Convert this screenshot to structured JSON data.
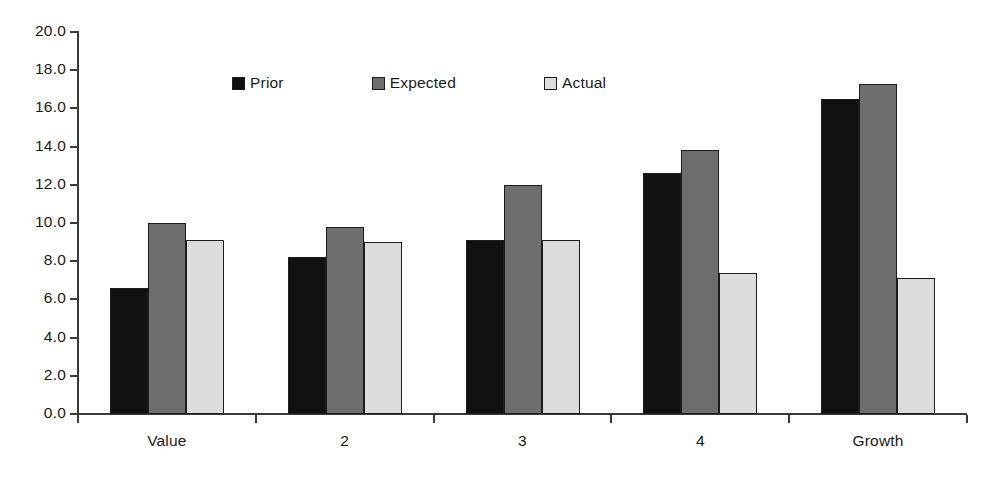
{
  "chart_data": {
    "type": "bar",
    "title": "",
    "subtitle": "",
    "xlabel": "",
    "ylabel": "",
    "categories": [
      "Value",
      "2",
      "3",
      "4",
      "Growth"
    ],
    "series": [
      {
        "name": "Prior",
        "color": "#111111",
        "values": [
          6.6,
          8.2,
          9.1,
          12.6,
          16.5
        ]
      },
      {
        "name": "Expected",
        "color": "#6e6e6e",
        "values": [
          10.0,
          9.8,
          12.0,
          13.8,
          17.3
        ]
      },
      {
        "name": "Actual",
        "color": "#dcdcdc",
        "values": [
          9.1,
          9.0,
          9.1,
          7.4,
          7.1
        ]
      }
    ],
    "ylim": [
      0.0,
      20.0
    ],
    "ytick_step": 2.0,
    "yticks": [
      "0.0",
      "2.0",
      "4.0",
      "6.0",
      "8.0",
      "10.0",
      "12.0",
      "14.0",
      "16.0",
      "18.0",
      "20.0"
    ],
    "grid": false,
    "legend_position": "top-center",
    "legend_entries": [
      "Prior",
      "Expected",
      "Actual"
    ],
    "annotations": []
  },
  "axis": {
    "line_color": "#3a3a3a",
    "tick_color": "#3a3a3a",
    "label_color": "#1a1a1a"
  }
}
